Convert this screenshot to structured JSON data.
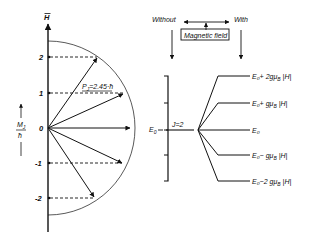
{
  "diagram": {
    "vector_model": {
      "axis_label": "H",
      "vertical_axis_label_num": "M",
      "vertical_axis_label_sub": "J",
      "vertical_axis_label_den": "ħ",
      "vector_length_label": "P",
      "vector_length_sub": "J",
      "vector_length_value": "=2.45·ħ",
      "ticks": [
        {
          "label": "2",
          "value": 2
        },
        {
          "label": "1",
          "value": 1
        },
        {
          "label": "0",
          "value": 0
        },
        {
          "label": "-1",
          "value": -1
        },
        {
          "label": "-2",
          "value": -2
        }
      ]
    },
    "field_header": {
      "without_label": "Without",
      "with_label": "With",
      "box_label": "Magnetic field"
    },
    "energy": {
      "base_label": "E",
      "base_sub": "0",
      "j_label": "J=2",
      "levels": [
        {
          "label": "E₀+ 2gμ",
          "tail": "B |H|",
          "m": 2
        },
        {
          "label": "E₀+  gμ",
          "tail": "B |H|",
          "m": 1
        },
        {
          "label": "E₀",
          "tail": "",
          "m": 0
        },
        {
          "label": "E₀−  gμ",
          "tail": "B |H|",
          "m": -1
        },
        {
          "label": "E₀−2 gμ",
          "tail": "B |H|",
          "m": -2
        }
      ]
    },
    "colors": {
      "ink": "#111111",
      "background": "#ffffff"
    }
  }
}
